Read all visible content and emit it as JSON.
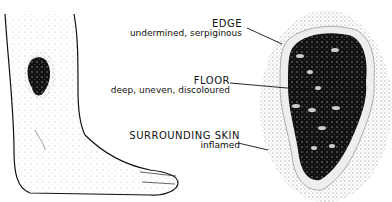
{
  "figure": {
    "labels": [
      {
        "id": "edge",
        "title": "EDGE",
        "subtitle": "undermined, serpiginous"
      },
      {
        "id": "floor",
        "title": "FLOOR",
        "subtitle": "deep, uneven, discoloured"
      },
      {
        "id": "surrounding",
        "title": "SURROUNDING SKIN",
        "subtitle": "inflamed"
      }
    ]
  }
}
